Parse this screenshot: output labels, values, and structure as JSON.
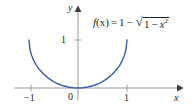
{
  "figure": {
    "equation": {
      "fname": "f",
      "var_paren": "(x)",
      "equals": "=",
      "one": "1",
      "minus": "−",
      "radical_sign": "√",
      "radicand_one": "1",
      "radicand_minus": "−",
      "radicand_var": "x",
      "radicand_exp": "2",
      "full_text": "f(x) = 1 − √(1 − x²)"
    },
    "axis_labels": {
      "x": "x",
      "y": "y"
    },
    "tick_labels": {
      "x_neg1": "−1",
      "x_pos1": "1",
      "origin": "0",
      "y_1": "1"
    },
    "colors": {
      "curve": "#3a5ea8",
      "axis": "#9a9a9a",
      "text": "#231f20",
      "background": "#ffffff"
    }
  },
  "chart_data": {
    "type": "line",
    "title": "",
    "subtitle": "",
    "xlabel": "x",
    "ylabel": "y",
    "xlim": [
      -1.45,
      1.9
    ],
    "ylim": [
      -0.25,
      1.7
    ],
    "xticks": [
      -1,
      0,
      1
    ],
    "xticklabels": [
      "−1",
      "0",
      "1"
    ],
    "yticks": [
      1
    ],
    "yticklabels": [
      "1"
    ],
    "grid": false,
    "legend": null,
    "annotations": [
      {
        "text": "f(x) = 1 − √(1 − x²)",
        "x": 0.35,
        "y": 1.45
      }
    ],
    "series": [
      {
        "name": "f(x) = 1 - sqrt(1 - x^2)",
        "color": "#3a5ea8",
        "x": [
          -1.0,
          -0.98,
          -0.95,
          -0.9,
          -0.85,
          -0.8,
          -0.7,
          -0.6,
          -0.5,
          -0.4,
          -0.3,
          -0.2,
          -0.1,
          0.0,
          0.1,
          0.2,
          0.3,
          0.4,
          0.5,
          0.6,
          0.7,
          0.8,
          0.85,
          0.9,
          0.95,
          0.98,
          1.0
        ],
        "y": [
          1.0,
          0.801,
          0.688,
          0.564,
          0.473,
          0.4,
          0.286,
          0.2,
          0.134,
          0.083,
          0.046,
          0.02,
          0.005,
          0.0,
          0.005,
          0.02,
          0.046,
          0.083,
          0.134,
          0.2,
          0.286,
          0.4,
          0.473,
          0.564,
          0.688,
          0.801,
          1.0
        ]
      }
    ]
  }
}
